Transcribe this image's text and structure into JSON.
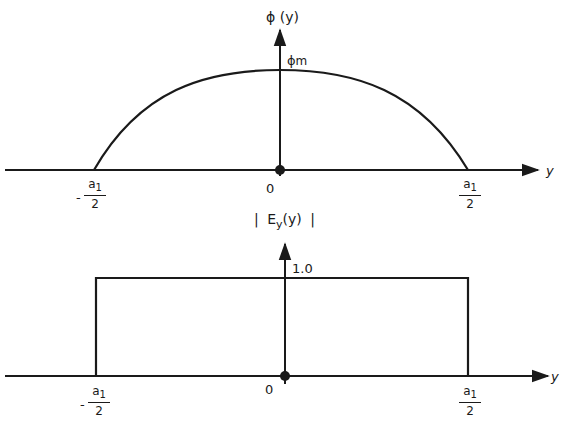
{
  "diagram": {
    "top_plot": {
      "y_axis_label": "ϕ (y)",
      "peak_label": "ϕm",
      "peak_label_main": "ϕ",
      "peak_label_sub": "m",
      "x_axis_label": "y",
      "origin_label": "0",
      "left_tick": {
        "sign": "-",
        "numerator": "a",
        "numerator_sub": "1",
        "denominator": "2"
      },
      "right_tick": {
        "numerator": "a",
        "numerator_sub": "1",
        "denominator": "2"
      },
      "curve": "cosine arc from -a1/2 to a1/2, peak ϕm at y=0"
    },
    "bottom_plot": {
      "y_axis_label_left": "|",
      "y_axis_label_main": "E",
      "y_axis_label_sub": "y",
      "y_axis_label_arg": "(y)",
      "y_axis_label_right": "|",
      "level_label": "1.0",
      "x_axis_label": "y",
      "origin_label": "0",
      "left_tick": {
        "sign": "-",
        "numerator": "a",
        "numerator_sub": "1",
        "denominator": "2"
      },
      "right_tick": {
        "numerator": "a",
        "numerator_sub": "1",
        "denominator": "2"
      },
      "curve": "rectangular pulse of height 1.0 from -a1/2 to a1/2"
    },
    "colors": {
      "ink": "#1a1a1a",
      "background": "#ffffff"
    }
  }
}
